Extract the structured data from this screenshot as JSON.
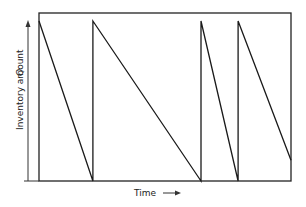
{
  "chart_data": {
    "type": "line",
    "title": "",
    "xlabel": "Time",
    "ylabel": "Inventory amount",
    "y_marker_label": "Q",
    "xlim": [
      0,
      10
    ],
    "ylim": [
      0,
      1.05
    ],
    "grid": false,
    "series": [
      {
        "name": "inventory",
        "points": [
          [
            0,
            1.0
          ],
          [
            2.14,
            0.0
          ],
          [
            2.14,
            1.0
          ],
          [
            6.43,
            0.0
          ],
          [
            6.43,
            1.0
          ],
          [
            7.9,
            0.0
          ],
          [
            7.9,
            1.0
          ],
          [
            10,
            0.13
          ]
        ]
      }
    ],
    "color": "#1a1a1a"
  }
}
